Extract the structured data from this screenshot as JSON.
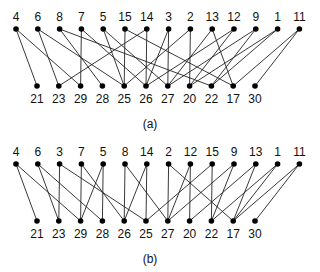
{
  "diagrams": [
    {
      "caption": "(a)",
      "top_nodes": [
        "4",
        "6",
        "8",
        "7",
        "5",
        "15",
        "14",
        "3",
        "2",
        "13",
        "12",
        "9",
        "1",
        "11"
      ],
      "bottom_nodes": [
        "21",
        "23",
        "29",
        "28",
        "25",
        "26",
        "27",
        "20",
        "22",
        "17",
        "30"
      ],
      "edges": [
        [
          "4",
          "21"
        ],
        [
          "4",
          "29"
        ],
        [
          "6",
          "23"
        ],
        [
          "6",
          "25"
        ],
        [
          "8",
          "28"
        ],
        [
          "8",
          "22"
        ],
        [
          "7",
          "29"
        ],
        [
          "7",
          "26"
        ],
        [
          "5",
          "25"
        ],
        [
          "5",
          "27"
        ],
        [
          "15",
          "25"
        ],
        [
          "15",
          "17"
        ],
        [
          "14",
          "23"
        ],
        [
          "14",
          "26"
        ],
        [
          "3",
          "26"
        ],
        [
          "3",
          "27"
        ],
        [
          "2",
          "25"
        ],
        [
          "2",
          "20"
        ],
        [
          "13",
          "27"
        ],
        [
          "13",
          "17"
        ],
        [
          "12",
          "26"
        ],
        [
          "12",
          "20"
        ],
        [
          "9",
          "27"
        ],
        [
          "9",
          "22"
        ],
        [
          "1",
          "20"
        ],
        [
          "1",
          "22"
        ],
        [
          "11",
          "17"
        ],
        [
          "11",
          "30"
        ]
      ]
    },
    {
      "caption": "(b)",
      "top_nodes": [
        "4",
        "6",
        "3",
        "7",
        "5",
        "8",
        "14",
        "2",
        "12",
        "15",
        "9",
        "13",
        "1",
        "11"
      ],
      "bottom_nodes": [
        "21",
        "23",
        "29",
        "28",
        "26",
        "25",
        "27",
        "20",
        "22",
        "17",
        "30"
      ],
      "edges": [
        [
          "4",
          "21"
        ],
        [
          "4",
          "29"
        ],
        [
          "6",
          "23"
        ],
        [
          "6",
          "28"
        ],
        [
          "3",
          "23"
        ],
        [
          "3",
          "25"
        ],
        [
          "7",
          "29"
        ],
        [
          "7",
          "26"
        ],
        [
          "5",
          "28"
        ],
        [
          "5",
          "29"
        ],
        [
          "8",
          "26"
        ],
        [
          "8",
          "27"
        ],
        [
          "14",
          "26"
        ],
        [
          "14",
          "25"
        ],
        [
          "2",
          "27"
        ],
        [
          "2",
          "17"
        ],
        [
          "12",
          "27"
        ],
        [
          "12",
          "20"
        ],
        [
          "15",
          "25"
        ],
        [
          "15",
          "22"
        ],
        [
          "9",
          "27"
        ],
        [
          "9",
          "22"
        ],
        [
          "13",
          "20"
        ],
        [
          "13",
          "17"
        ],
        [
          "1",
          "22"
        ],
        [
          "1",
          "17"
        ],
        [
          "11",
          "17"
        ],
        [
          "11",
          "30"
        ]
      ]
    }
  ]
}
